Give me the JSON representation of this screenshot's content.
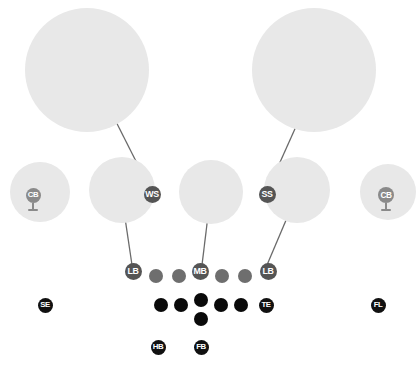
{
  "diagram": {
    "type": "football-play-diagram",
    "width": 418,
    "height": 365,
    "background_color": "#ffffff"
  },
  "colors": {
    "zone_fill": "#e8e8e8",
    "offense_dot": "#0a0a0a",
    "defense_dot": "#6e6e6e",
    "marker_dark": "#111111",
    "marker_mid": "#555555",
    "marker_faint": "#8a8a8a",
    "arrow": "#6a6a6a"
  },
  "zones": [
    {
      "name": "deep-left-zone",
      "label": "",
      "cx": 87,
      "cy": 70,
      "r": 62
    },
    {
      "name": "deep-right-zone",
      "label": "",
      "cx": 314,
      "cy": 70,
      "r": 62
    },
    {
      "name": "flat-left-zone",
      "label": "",
      "cx": 40,
      "cy": 192,
      "r": 30
    },
    {
      "name": "hook-left-zone",
      "label": "",
      "cx": 122,
      "cy": 190,
      "r": 33
    },
    {
      "name": "middle-hook-zone",
      "label": "",
      "cx": 211,
      "cy": 192,
      "r": 32
    },
    {
      "name": "hook-right-zone",
      "label": "",
      "cx": 297,
      "cy": 190,
      "r": 33
    },
    {
      "name": "flat-right-zone",
      "label": "",
      "cx": 388,
      "cy": 192,
      "r": 28
    }
  ],
  "players": {
    "defense_backs": [
      {
        "name": "cornerback-left",
        "label": "CB",
        "x": 33,
        "y": 195,
        "size": 15,
        "style": "faint",
        "pin": true
      },
      {
        "name": "weak-safety",
        "label": "WS",
        "x": 152,
        "y": 194,
        "size": 17,
        "style": "mid",
        "pin": false
      },
      {
        "name": "strong-safety",
        "label": "SS",
        "x": 267,
        "y": 194,
        "size": 17,
        "style": "mid",
        "pin": false
      },
      {
        "name": "cornerback-right",
        "label": "CB",
        "x": 386,
        "y": 195,
        "size": 16,
        "style": "faint",
        "pin": true
      }
    ],
    "linebackers": [
      {
        "name": "linebacker-left",
        "label": "LB",
        "x": 133,
        "y": 271,
        "size": 17,
        "style": "mid"
      },
      {
        "name": "middle-linebacker",
        "label": "MB",
        "x": 200,
        "y": 271,
        "size": 17,
        "style": "mid"
      },
      {
        "name": "linebacker-right",
        "label": "LB",
        "x": 268,
        "y": 271,
        "size": 17,
        "style": "mid"
      }
    ],
    "defensive_line": [
      {
        "name": "defensive-lineman-1",
        "x": 156,
        "y": 276,
        "size": 14
      },
      {
        "name": "defensive-lineman-2",
        "x": 179,
        "y": 276,
        "size": 14
      },
      {
        "name": "defensive-lineman-3",
        "x": 222,
        "y": 276,
        "size": 14
      },
      {
        "name": "defensive-lineman-4",
        "x": 245,
        "y": 276,
        "size": 14
      }
    ],
    "offensive_line": [
      {
        "name": "offensive-lineman-left-tackle",
        "x": 161,
        "y": 305,
        "size": 14
      },
      {
        "name": "offensive-lineman-left-guard",
        "x": 181,
        "y": 305,
        "size": 14
      },
      {
        "name": "offensive-lineman-center",
        "x": 201,
        "y": 300,
        "size": 14
      },
      {
        "name": "offensive-lineman-right-guard",
        "x": 221,
        "y": 305,
        "size": 14
      },
      {
        "name": "offensive-lineman-right-tackle",
        "x": 241,
        "y": 305,
        "size": 14
      },
      {
        "name": "quarterback",
        "x": 201,
        "y": 319,
        "size": 14
      }
    ],
    "receivers": [
      {
        "name": "split-end",
        "label": "SE",
        "x": 45,
        "y": 305,
        "size": 15,
        "style": "dark"
      },
      {
        "name": "tight-end",
        "label": "TE",
        "x": 266,
        "y": 305,
        "size": 15,
        "style": "dark"
      },
      {
        "name": "flanker",
        "label": "FL",
        "x": 378,
        "y": 305,
        "size": 15,
        "style": "dark"
      }
    ],
    "backs": [
      {
        "name": "halfback",
        "label": "HB",
        "x": 158,
        "y": 347,
        "size": 15,
        "style": "dark"
      },
      {
        "name": "fullback",
        "label": "FB",
        "x": 201,
        "y": 347,
        "size": 15,
        "style": "dark"
      }
    ]
  },
  "arrows": [
    {
      "name": "arrow-weak-safety-to-deep-left",
      "x1": 150,
      "y1": 189,
      "x2": 99,
      "y2": 88
    },
    {
      "name": "arrow-strong-safety-to-deep-right",
      "x1": 268,
      "y1": 189,
      "x2": 320,
      "y2": 73
    },
    {
      "name": "arrow-linebacker-left-to-hook",
      "x1": 132,
      "y1": 265,
      "x2": 121,
      "y2": 191
    },
    {
      "name": "arrow-middle-linebacker-to-middle",
      "x1": 202,
      "y1": 265,
      "x2": 211,
      "y2": 191
    },
    {
      "name": "arrow-linebacker-right-to-hook",
      "x1": 267,
      "y1": 265,
      "x2": 298,
      "y2": 192
    }
  ]
}
